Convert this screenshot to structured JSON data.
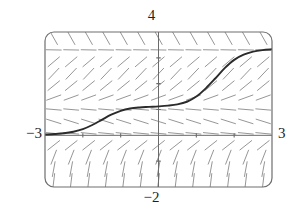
{
  "figure": {
    "kind": "slope-field-plot",
    "background": "#ffffff"
  },
  "labels": {
    "top": "4",
    "bottom": "−2",
    "left": "−3",
    "right": "3"
  },
  "colors": {
    "frame": "#6e6e6e",
    "axis": "#6b6b6b",
    "slope_mark": "#8a8a8a",
    "solution_curve": "#2b2b2b",
    "text": "#1f1f1f"
  },
  "chart_data": {
    "type": "line",
    "title": "",
    "subtitle": "",
    "xlabel": "",
    "ylabel": "",
    "xlim": [
      -3,
      3
    ],
    "ylim": [
      -2,
      4
    ],
    "grid": false,
    "legend": null,
    "legend_position": "none",
    "tick_labels": {
      "x": [
        "−3",
        "3"
      ],
      "y": [
        "−2",
        "4"
      ]
    },
    "x_axis_ticks": [
      -2,
      -1,
      1,
      2
    ],
    "y_axis_ticks": [
      -1,
      1,
      2,
      3
    ],
    "frame": {
      "rounded": true,
      "corner_radius_px": 9,
      "left_px": 45,
      "right_px": 272,
      "top_px": 32,
      "bottom_px": 187
    },
    "annotations": [
      "Slope field (direction field) of a first-order ODE",
      "Equilibrium (flat) slopes near y = 0, y ≈ 1.1 and y ≈ 3.3",
      "Steepest positive slopes between the equilibria above the x-axis",
      "Negative-sloping marks below the x-axis"
    ],
    "slope_field": {
      "description": "dy/dx modeled as k*y*(y-1.1)*(y-3.3) normalized for display",
      "equilibria": [
        0,
        1.1,
        3.3
      ],
      "k": -0.55,
      "nx": 13,
      "ny": 13,
      "mark_length_px": 15
    },
    "series": [
      {
        "name": "solution curve",
        "description": "Double-S solution rising from y≈0 at x=−3 through a plateau near y≈1.1 to a plateau near y≈3.3 at x=3",
        "x": [
          -3.0,
          -2.75,
          -2.5,
          -2.25,
          -2.0,
          -1.75,
          -1.5,
          -1.25,
          -1.0,
          -0.75,
          -0.5,
          -0.25,
          0.0,
          0.25,
          0.5,
          0.75,
          1.0,
          1.25,
          1.5,
          1.75,
          2.0,
          2.25,
          2.5,
          2.75,
          3.0
        ],
        "y": [
          0.03,
          0.05,
          0.08,
          0.14,
          0.24,
          0.4,
          0.6,
          0.8,
          0.95,
          1.04,
          1.08,
          1.1,
          1.12,
          1.15,
          1.2,
          1.3,
          1.5,
          1.82,
          2.2,
          2.6,
          2.92,
          3.12,
          3.24,
          3.3,
          3.33
        ]
      }
    ]
  }
}
